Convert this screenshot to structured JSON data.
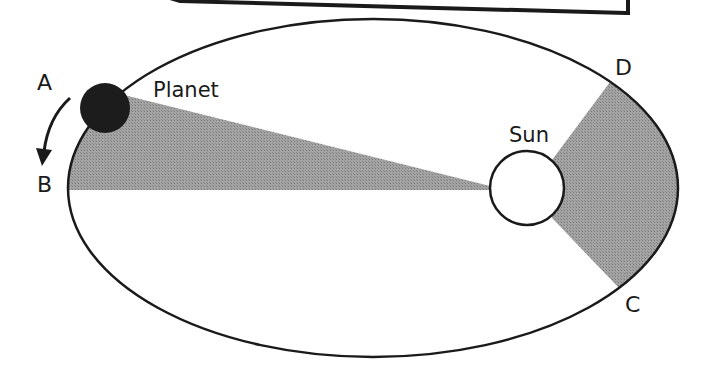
{
  "diagram": {
    "labels": {
      "point_a": "A",
      "point_b": "B",
      "point_c": "C",
      "point_d": "D",
      "planet": "Planet",
      "sun": "Sun"
    },
    "colors": {
      "background": "#ffffff",
      "stroke": "#1a1a1a",
      "swept_area": "#9a9a9a",
      "planet_fill": "#1c1c1c",
      "sun_fill": "#ffffff"
    },
    "orbit": {
      "cx": 373,
      "cy": 188,
      "rx": 305,
      "ry": 169
    },
    "planet_body": {
      "cx": 105,
      "cy": 108,
      "r": 25
    },
    "sun_body": {
      "cx": 527,
      "cy": 188,
      "r": 37
    },
    "wedge_ab": {
      "apex": [
        490,
        186
      ],
      "from": "A",
      "to": "B"
    },
    "wedge_cd": {
      "apex_top": [
        552,
        160
      ],
      "apex_bottom": [
        552,
        218
      ],
      "from": "C",
      "to": "D"
    },
    "motion_arrow": {
      "direction": "A to B"
    }
  }
}
